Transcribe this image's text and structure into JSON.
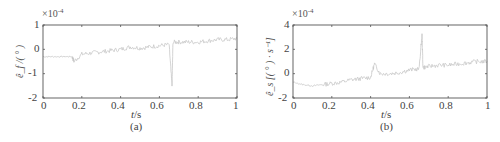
{
  "chart_data": [
    {
      "type": "line",
      "panel": "(a)",
      "title": "",
      "xlabel": "t/s",
      "ylabel": "ê_f /(°)",
      "y_scale_label": "×10⁻⁴",
      "y_multiplier": 0.0001,
      "xlim": [
        0,
        1
      ],
      "ylim": [
        -2,
        1
      ],
      "xticks": [
        "0",
        "0.2",
        "0.4",
        "0.6",
        "0.8",
        "1"
      ],
      "yticks": [
        "-2",
        "-1",
        "0",
        "1"
      ],
      "grid": false,
      "line_color": "#c8c8c8",
      "x": [
        0,
        0.05,
        0.1,
        0.15,
        0.16,
        0.2,
        0.25,
        0.3,
        0.35,
        0.4,
        0.45,
        0.5,
        0.55,
        0.6,
        0.65,
        0.665,
        0.67,
        0.7,
        0.75,
        0.8,
        0.85,
        0.9,
        0.95,
        1.0
      ],
      "values": [
        -0.3,
        -0.3,
        -0.3,
        -0.3,
        -0.5,
        -0.2,
        -0.15,
        -0.1,
        -0.05,
        0.0,
        0.1,
        0.05,
        0.1,
        0.15,
        0.2,
        -1.5,
        0.3,
        0.3,
        0.3,
        0.3,
        0.35,
        0.4,
        0.4,
        0.45
      ]
    },
    {
      "type": "line",
      "panel": "(b)",
      "title": "",
      "xlabel": "t/s",
      "ylabel": "ê_s [(°)·s⁻¹]",
      "y_scale_label": "×10⁻⁴",
      "y_multiplier": 0.0001,
      "xlim": [
        0,
        1
      ],
      "ylim": [
        -2,
        4
      ],
      "xticks": [
        "0",
        "0.2",
        "0.4",
        "0.6",
        "0.8",
        "1"
      ],
      "yticks": [
        "-2",
        "0",
        "2",
        "4"
      ],
      "grid": false,
      "line_color": "#c8c8c8",
      "x": [
        0,
        0.05,
        0.1,
        0.15,
        0.2,
        0.25,
        0.3,
        0.35,
        0.4,
        0.42,
        0.45,
        0.5,
        0.55,
        0.6,
        0.65,
        0.665,
        0.67,
        0.7,
        0.75,
        0.8,
        0.85,
        0.9,
        0.95,
        1.0
      ],
      "values": [
        -0.7,
        -0.9,
        -1.0,
        -0.9,
        -0.8,
        -0.7,
        -0.5,
        -0.4,
        -0.3,
        0.8,
        0.0,
        0.0,
        0.1,
        0.3,
        0.4,
        3.2,
        0.5,
        0.6,
        0.7,
        0.7,
        0.8,
        0.9,
        1.0,
        1.0
      ]
    }
  ],
  "panels": {
    "a": {
      "caption": "(a)",
      "exp_base": "×10",
      "exp_power": "-4",
      "ylabel": "ê_f /( ° )",
      "xlabel_var": "t",
      "xlabel_unit": "/s",
      "xticks": [
        "0",
        "0.2",
        "0.4",
        "0.6",
        "0.8",
        "1"
      ],
      "yticks": [
        "1",
        "0",
        "-1",
        "-2"
      ]
    },
    "b": {
      "caption": "(b)",
      "exp_base": "×10",
      "exp_power": "-4",
      "ylabel": "ê_s [( ° ) · s⁻¹]",
      "xlabel_var": "t",
      "xlabel_unit": "/s",
      "xticks": [
        "0",
        "0.2",
        "0.4",
        "0.6",
        "0.8",
        "1"
      ],
      "yticks": [
        "4",
        "2",
        "0",
        "-2"
      ]
    }
  }
}
